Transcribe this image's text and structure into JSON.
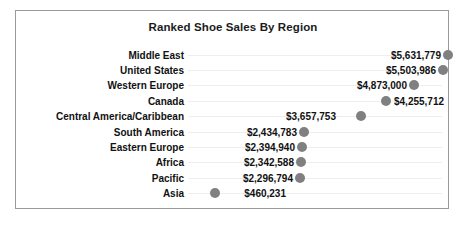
{
  "chart_data": {
    "type": "scatter",
    "title": "Ranked Shoe Sales By Region",
    "xlabel": "",
    "ylabel": "",
    "grid": true,
    "legend": false,
    "orientation": "horizontal",
    "xlim": [
      0,
      6000000
    ],
    "categories": [
      "Middle East",
      "United States",
      "Western Europe",
      "Canada",
      "Central America/Caribbean",
      "South America",
      "Eastern Europe",
      "Africa",
      "Pacific",
      "Asia"
    ],
    "values": [
      5631779,
      5503986,
      4873000,
      4255712,
      3657753,
      2434783,
      2394940,
      2342588,
      2296794,
      460231
    ],
    "value_labels": [
      "$5,631,779",
      "$5,503,986",
      "$4,873,000",
      "$4,255,712",
      "$3,657,753",
      "$2,434,783",
      "$2,394,940",
      "$2,342,588",
      "$2,296,794",
      "$460,231"
    ],
    "marker": "circle",
    "marker_color": "#808080"
  },
  "rows": [
    {
      "label": "Middle East",
      "value_label": "$5,631,779",
      "dot_x": 432,
      "label_side": "left",
      "label_x": 425
    },
    {
      "label": "United States",
      "value_label": "$5,503,986",
      "dot_x": 427,
      "label_x": 420,
      "label_side": "left"
    },
    {
      "label": "Western Europe",
      "value_label": "$4,873,000",
      "dot_x": 398,
      "label_x": 391,
      "label_side": "left"
    },
    {
      "label": "Canada",
      "value_label": "$4,255,712",
      "dot_x": 370,
      "label_x": 378,
      "label_side": "right"
    },
    {
      "label": "Central America/Caribbean",
      "value_label": "$3,657,753",
      "dot_x": 345,
      "label_x": 320,
      "label_side": "left"
    },
    {
      "label": "South America",
      "value_label": "$2,434,783",
      "dot_x": 288,
      "label_x": 281,
      "label_side": "left"
    },
    {
      "label": "Eastern Europe",
      "value_label": "$2,394,940",
      "dot_x": 286,
      "label_x": 279,
      "label_side": "left"
    },
    {
      "label": "Africa",
      "value_label": "$2,342,588",
      "dot_x": 285,
      "label_x": 278,
      "label_side": "left"
    },
    {
      "label": "Pacific",
      "value_label": "$2,296,794",
      "dot_x": 284,
      "label_x": 277,
      "label_side": "left"
    },
    {
      "label": "Asia",
      "value_label": "$460,231",
      "dot_x": 199,
      "label_x": 270,
      "label_side": "left"
    }
  ],
  "colors": {
    "marker": "#808080",
    "text": "#111111",
    "frame_border": "#9a9a9a",
    "gridline": "#eeeeee",
    "background": "#ffffff"
  }
}
